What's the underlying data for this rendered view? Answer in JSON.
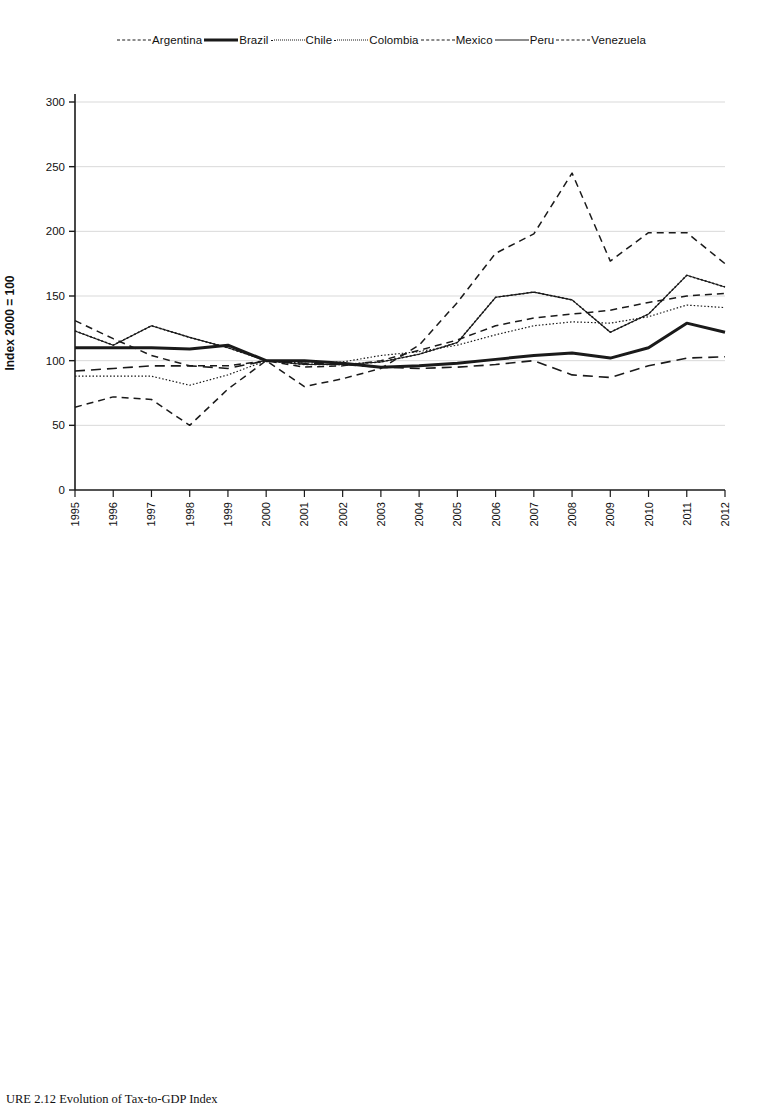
{
  "figure": {
    "caption": "URE 2.12  Evolution of Tax-to-GDP Index",
    "caption_prefix": "URE 2.12"
  },
  "panels": [
    {
      "id": "south-america",
      "legend": [
        {
          "label": "Argentina",
          "style": "dashed"
        },
        {
          "label": "Brazil",
          "style": "solid-thick"
        },
        {
          "label": "Chile",
          "style": "dotted"
        },
        {
          "label": "Colombia",
          "style": "dotted-fine"
        },
        {
          "label": "Mexico",
          "style": "dashed-long"
        },
        {
          "label": "Peru",
          "style": "solid-thin"
        },
        {
          "label": "Venezuela",
          "style": "dashed"
        }
      ]
    },
    {
      "id": "central-america",
      "legend": [
        {
          "label": "Costa Rica",
          "style": "dotted"
        },
        {
          "label": "Guatemala",
          "style": "solid-thin"
        },
        {
          "label": "Honduras",
          "style": "solid-thick"
        },
        {
          "label": "Nicaragua",
          "style": "solid-thin"
        },
        {
          "label": "Panama",
          "style": "solid-thin"
        },
        {
          "label": "El Salvador",
          "style": "dashed"
        }
      ]
    }
  ],
  "chart_data": [
    {
      "type": "line",
      "title": "",
      "xlabel": "",
      "ylabel": "Index 2000 = 100",
      "ylim": [
        0,
        300
      ],
      "yticks": [
        0,
        50,
        100,
        150,
        200,
        250,
        300
      ],
      "grid": true,
      "legend_position": "top",
      "x": [
        1995,
        1996,
        1997,
        1998,
        1999,
        2000,
        2001,
        2002,
        2003,
        2004,
        2005,
        2006,
        2007,
        2008,
        2009,
        2010,
        2011,
        2012
      ],
      "series": [
        {
          "name": "Argentina",
          "style": "dashed",
          "values": [
            131,
            117,
            104,
            96,
            96,
            100,
            95,
            96,
            100,
            108,
            116,
            127,
            133,
            136,
            139,
            145,
            150,
            152
          ]
        },
        {
          "name": "Brazil",
          "style": "solid-thick",
          "values": [
            110,
            110,
            110,
            109,
            112,
            100,
            100,
            98,
            95,
            96,
            98,
            101,
            104,
            106,
            102,
            110,
            129,
            122
          ]
        },
        {
          "name": "Chile",
          "style": "dotted",
          "values": [
            123,
            112,
            127,
            118,
            110,
            100,
            97,
            97,
            99,
            105,
            114,
            149,
            153,
            147,
            122,
            136,
            166,
            157
          ]
        },
        {
          "name": "Colombia",
          "style": "dotted-fine",
          "values": [
            88,
            88,
            88,
            81,
            89,
            100,
            98,
            99,
            104,
            107,
            112,
            120,
            127,
            130,
            129,
            134,
            143,
            141
          ]
        },
        {
          "name": "Mexico",
          "style": "dashed-long",
          "values": [
            92,
            94,
            96,
            96,
            94,
            100,
            98,
            97,
            95,
            94,
            95,
            97,
            100,
            89,
            87,
            96,
            102,
            103
          ]
        },
        {
          "name": "Peru",
          "style": "solid-thin",
          "values": [
            123,
            112,
            127,
            118,
            110,
            100,
            97,
            97,
            99,
            105,
            114,
            149,
            153,
            147,
            122,
            136,
            166,
            157
          ]
        },
        {
          "name": "Venezuela",
          "style": "dashed",
          "values": [
            64,
            72,
            70,
            50,
            78,
            100,
            80,
            86,
            94,
            112,
            145,
            183,
            198,
            245,
            177,
            199,
            199,
            175
          ]
        }
      ]
    },
    {
      "type": "line",
      "title": "",
      "xlabel": "",
      "ylabel": "Index 2000 = 100",
      "ylim": [
        0,
        300
      ],
      "yticks": [
        0,
        50,
        100,
        150,
        200,
        250,
        300
      ],
      "grid": true,
      "legend_position": "top",
      "x": [
        1995,
        1996,
        1997,
        1998,
        1999,
        2000,
        2001,
        2002,
        2003,
        2004,
        2005,
        2006,
        2007,
        2008,
        2009,
        2010,
        2011,
        2012
      ],
      "series": [
        {
          "name": "Costa Rica",
          "style": "dotted",
          "values": [
            105,
            103,
            106,
            111,
            104,
            100,
            95,
            93,
            91,
            88,
            86,
            85,
            83,
            80,
            78,
            76,
            73,
            71
          ]
        },
        {
          "name": "Guatemala",
          "style": "solid-thin",
          "values": [
            129,
            112,
            105,
            113,
            106,
            100,
            97,
            94,
            91,
            88,
            86,
            84,
            81,
            76,
            78,
            79,
            81,
            81
          ]
        },
        {
          "name": "Honduras",
          "style": "solid-thick",
          "values": [
            118,
            89,
            107,
            113,
            105,
            100,
            87,
            88,
            87,
            85,
            83,
            81,
            78,
            71,
            76,
            79,
            83,
            80
          ]
        },
        {
          "name": "Nicaragua",
          "style": "solid-thin",
          "values": [
            96,
            96,
            104,
            110,
            105,
            100,
            87,
            86,
            85,
            84,
            82,
            80,
            77,
            72,
            74,
            77,
            80,
            79
          ]
        },
        {
          "name": "Panama",
          "style": "solid-thin",
          "values": [
            116,
            100,
            103,
            109,
            104,
            100,
            95,
            95,
            93,
            90,
            88,
            87,
            85,
            82,
            86,
            83,
            81,
            80
          ]
        },
        {
          "name": "El Salvador",
          "style": "dashed",
          "values": [
            124,
            112,
            107,
            112,
            106,
            100,
            96,
            95,
            94,
            92,
            91,
            90,
            89,
            88,
            87,
            85,
            84,
            83
          ]
        }
      ]
    }
  ]
}
